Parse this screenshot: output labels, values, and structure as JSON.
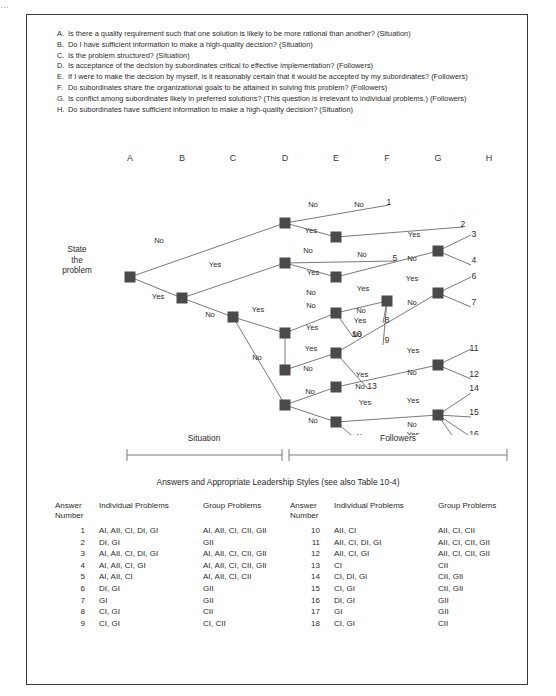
{
  "top_crop_text": "…",
  "questions": [
    {
      "letter": "A.",
      "text": "Is there a quality requirement such that one solution is likely to be more rational than another? (Situation)"
    },
    {
      "letter": "B.",
      "text": "Do I have sufficient information to make a high-quality decision? (Situation)"
    },
    {
      "letter": "C.",
      "text": "Is the problem structured? (Situation)"
    },
    {
      "letter": "D.",
      "text": "Is acceptance of the decision by subordinates critical to effective implementation? (Followers)"
    },
    {
      "letter": "E.",
      "text": "If I were to make the decision by myself, is it reasonably certain that it would be accepted by my subordinates? (Followers)"
    },
    {
      "letter": "F.",
      "text": "Do subordinates share the organizational goals to be attained in solving this problem? (Followers)"
    },
    {
      "letter": "G.",
      "text": "Is conflict among subordinates likely in preferred solutions? (This question is irrelevant to individual problems.) (Followers)"
    },
    {
      "letter": "H.",
      "text": "Do subordinates have sufficient information to make a high-quality decision? (Situation)"
    }
  ],
  "column_headers": [
    {
      "label": "A",
      "x": 103
    },
    {
      "label": "B",
      "x": 155
    },
    {
      "label": "C",
      "x": 206
    },
    {
      "label": "D",
      "x": 258
    },
    {
      "label": "E",
      "x": 309
    },
    {
      "label": "F",
      "x": 360
    },
    {
      "label": "G",
      "x": 411
    },
    {
      "label": "H",
      "x": 462
    }
  ],
  "root_label": "State\nthe\nproblem",
  "root_label_lines": [
    "State",
    "the",
    "problem"
  ],
  "brackets": [
    {
      "label": "Situation",
      "x1": 100,
      "x2": 255,
      "cx": 177
    },
    {
      "label": "Followers",
      "x1": 262,
      "x2": 480,
      "cx": 371
    }
  ],
  "table_title": "Answers and Appropriate Leadership Styles (see also Table 10-4)",
  "table_headers": {
    "answer": "Answer",
    "number": "Number",
    "individual": "Individual Problems",
    "group": "Group Problems"
  },
  "table_left": [
    {
      "n": "1",
      "ind": "AI, AII, CI, DI, GI",
      "grp": "AI, AII, CI, CII, GII"
    },
    {
      "n": "2",
      "ind": "DI, GI",
      "grp": "GII"
    },
    {
      "n": "3",
      "ind": "AI, AII, CI, DI, GI",
      "grp": "AI, AII, CI, CII, GII"
    },
    {
      "n": "4",
      "ind": "AI, AII, CI, GI",
      "grp": "AI, AII, CI, CII, GII"
    },
    {
      "n": "5",
      "ind": "AI, AII, CI",
      "grp": "AI, AII, CI, CII"
    },
    {
      "n": "6",
      "ind": "DI, GI",
      "grp": "GII"
    },
    {
      "n": "7",
      "ind": "GI",
      "grp": "GII"
    },
    {
      "n": "8",
      "ind": "CI, GI",
      "grp": "CII"
    },
    {
      "n": "9",
      "ind": "CI, GI",
      "grp": "CI, CII"
    }
  ],
  "table_right": [
    {
      "n": "10",
      "ind": "AII, CI",
      "grp": "AII, CI, CII"
    },
    {
      "n": "11",
      "ind": "AII, CI, DI, GI",
      "grp": "AII, CI, CII, GII"
    },
    {
      "n": "12",
      "ind": "AII, CI, GI",
      "grp": "AII, CI, CII, GII"
    },
    {
      "n": "13",
      "ind": "CI",
      "grp": "CII"
    },
    {
      "n": "14",
      "ind": "CI, DI, GI",
      "grp": "CII, GII"
    },
    {
      "n": "15",
      "ind": "CI, GI",
      "grp": "CII, GII"
    },
    {
      "n": "16",
      "ind": "DI, GI",
      "grp": "GII"
    },
    {
      "n": "17",
      "ind": "GI",
      "grp": "GII"
    },
    {
      "n": "18",
      "ind": "CI, GI",
      "grp": "CII"
    }
  ],
  "chart_data": {
    "type": "diagram",
    "node_color": "#4a4a4a",
    "line_color": "#6b6b6b",
    "nodes": [
      {
        "id": "root",
        "x": 103,
        "y": 112
      },
      {
        "id": "b1",
        "x": 155,
        "y": 133
      },
      {
        "id": "c1",
        "x": 206,
        "y": 152
      },
      {
        "id": "d1",
        "x": 258,
        "y": 58
      },
      {
        "id": "d2",
        "x": 258,
        "y": 98
      },
      {
        "id": "d3",
        "x": 258,
        "y": 168
      },
      {
        "id": "d4",
        "x": 258,
        "y": 205
      },
      {
        "id": "d5",
        "x": 258,
        "y": 240
      },
      {
        "id": "e1",
        "x": 309,
        "y": 72
      },
      {
        "id": "e2",
        "x": 309,
        "y": 112
      },
      {
        "id": "e3",
        "x": 309,
        "y": 148
      },
      {
        "id": "e4",
        "x": 309,
        "y": 188
      },
      {
        "id": "e5",
        "x": 309,
        "y": 222
      },
      {
        "id": "e6",
        "x": 309,
        "y": 257
      },
      {
        "id": "f1",
        "x": 360,
        "y": 136
      },
      {
        "id": "g1",
        "x": 411,
        "y": 86
      },
      {
        "id": "g2",
        "x": 411,
        "y": 128
      },
      {
        "id": "g3",
        "x": 411,
        "y": 200
      },
      {
        "id": "g4",
        "x": 411,
        "y": 250
      }
    ],
    "branch_labels": [
      {
        "text": "No",
        "x": 132,
        "y": 78
      },
      {
        "text": "Yes",
        "x": 131,
        "y": 134
      },
      {
        "text": "Yes",
        "x": 188,
        "y": 102
      },
      {
        "text": "No",
        "x": 183,
        "y": 152
      },
      {
        "text": "Yes",
        "x": 231,
        "y": 147
      },
      {
        "text": "No",
        "x": 230,
        "y": 195
      },
      {
        "text": "No",
        "x": 286,
        "y": 42
      },
      {
        "text": "Yes",
        "x": 284,
        "y": 68
      },
      {
        "text": "No",
        "x": 281,
        "y": 88
      },
      {
        "text": "Yes",
        "x": 286,
        "y": 110
      },
      {
        "text": "No",
        "x": 284,
        "y": 130
      },
      {
        "text": "No",
        "x": 284,
        "y": 143
      },
      {
        "text": "Yes",
        "x": 285,
        "y": 165
      },
      {
        "text": "Yes",
        "x": 284,
        "y": 186
      },
      {
        "text": "No",
        "x": 281,
        "y": 206
      },
      {
        "text": "No",
        "x": 283,
        "y": 229
      },
      {
        "text": "No",
        "x": 286,
        "y": 258
      },
      {
        "text": "Yes",
        "x": 286,
        "y": 284
      },
      {
        "text": "No",
        "x": 332,
        "y": 42
      },
      {
        "text": "No",
        "x": 335,
        "y": 92
      },
      {
        "text": "Yes",
        "x": 336,
        "y": 126
      },
      {
        "text": "No",
        "x": 334,
        "y": 148
      },
      {
        "text": "Yes",
        "x": 333,
        "y": 158
      },
      {
        "text": "No",
        "x": 330,
        "y": 172
      },
      {
        "text": "Yes",
        "x": 335,
        "y": 212
      },
      {
        "text": "No",
        "x": 333,
        "y": 224
      },
      {
        "text": "Yes",
        "x": 338,
        "y": 240
      },
      {
        "text": "Yes",
        "x": 336,
        "y": 274
      },
      {
        "text": "No",
        "x": 330,
        "y": 290
      },
      {
        "text": "Yes",
        "x": 387,
        "y": 72
      },
      {
        "text": "No",
        "x": 385,
        "y": 96
      },
      {
        "text": "Yes",
        "x": 385,
        "y": 116
      },
      {
        "text": "No",
        "x": 385,
        "y": 140
      },
      {
        "text": "Yes",
        "x": 386,
        "y": 188
      },
      {
        "text": "No",
        "x": 385,
        "y": 210
      },
      {
        "text": "Yes",
        "x": 386,
        "y": 238
      },
      {
        "text": "No",
        "x": 385,
        "y": 262
      },
      {
        "text": "Yes",
        "x": 386,
        "y": 272
      },
      {
        "text": "No",
        "x": 385,
        "y": 296
      }
    ],
    "outcomes": [
      {
        "n": "1",
        "x": 362,
        "y": 40
      },
      {
        "n": "2",
        "x": 436,
        "y": 62
      },
      {
        "n": "3",
        "x": 447,
        "y": 72
      },
      {
        "n": "4",
        "x": 447,
        "y": 98
      },
      {
        "n": "5",
        "x": 368,
        "y": 96
      },
      {
        "n": "6",
        "x": 447,
        "y": 114
      },
      {
        "n": "7",
        "x": 447,
        "y": 140
      },
      {
        "n": "8",
        "x": 360,
        "y": 158
      },
      {
        "n": "9",
        "x": 360,
        "y": 178
      },
      {
        "n": "10",
        "x": 330,
        "y": 172
      },
      {
        "n": "11",
        "x": 447,
        "y": 186
      },
      {
        "n": "12",
        "x": 447,
        "y": 212
      },
      {
        "n": "13",
        "x": 345,
        "y": 224
      },
      {
        "n": "14",
        "x": 447,
        "y": 226
      },
      {
        "n": "15",
        "x": 447,
        "y": 250
      },
      {
        "n": "16",
        "x": 447,
        "y": 272
      },
      {
        "n": "17",
        "x": 447,
        "y": 296
      },
      {
        "n": "18",
        "x": 363,
        "y": 300
      }
    ]
  }
}
